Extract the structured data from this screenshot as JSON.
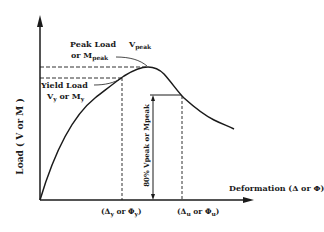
{
  "diagram": {
    "y_axis_label": "Load ( V or M )",
    "x_axis_label": "Deformation (Δ or Φ)",
    "peak_label": {
      "line1": "Peak Load",
      "v_symbol": "V",
      "v_sub": "peak",
      "line2": "or M",
      "m_sub": "peak"
    },
    "yield_label": {
      "line1": "Yield Load",
      "line2_a": "V",
      "line2_a_sub": "y",
      "line2_b": " or M",
      "line2_b_sub": "y"
    },
    "eighty_pct_label": "80% Vₚₑₐₖ or Mₚₑₐₖ",
    "eighty_pct_text": "80% Vpeak or Mpeak",
    "x_tick_yield": {
      "open": "(Δ",
      "sub1": "y",
      "mid": " or  Φ",
      "sub2": "y",
      "close": ")"
    },
    "x_tick_ultimate": {
      "open": "(Δ",
      "sub1": "u",
      "mid": " or  Φ",
      "sub2": "u",
      "close": ")"
    },
    "colors": {
      "ink": "#1a1a1a",
      "background": "#ffffff"
    }
  }
}
